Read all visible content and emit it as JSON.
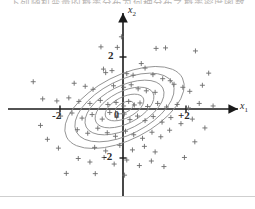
{
  "caption": {
    "text": "下列随机变量的概率分布为何种分布之概率密度函数"
  },
  "figure": {
    "title": "",
    "axes": {
      "x_label": "x",
      "x_sub": "1",
      "y_label": "x",
      "y_sub": "2",
      "origin_label": "0"
    },
    "ticks": {
      "x": [
        {
          "value": -2,
          "label": "-2",
          "px": 60
        },
        {
          "value": 2,
          "label": "+2",
          "px": 186
        }
      ],
      "y": [
        {
          "value": 2,
          "label": "2",
          "px": 57
        },
        {
          "value": -2,
          "label": "-2",
          "px": 158
        }
      ]
    }
  },
  "chart_data": {
    "type": "scatter",
    "title": "",
    "xlabel": "x1",
    "ylabel": "x2",
    "xlim": [
      -3.2,
      3.4
    ],
    "ylim": [
      -3.0,
      3.0
    ],
    "grid": false,
    "legend": null,
    "marker": "plus",
    "marker_color": "#6b6b6b",
    "contour": {
      "type": "gaussian-ellipses",
      "count": 6,
      "center": [
        0.05,
        -0.05
      ],
      "rotation_deg": -27,
      "correlation": 0.72,
      "semi_axes_major": [
        0.34,
        0.72,
        1.08,
        1.45,
        1.82,
        2.18
      ],
      "semi_axes_minor": [
        0.17,
        0.36,
        0.54,
        0.72,
        0.9,
        1.08
      ],
      "line_color": "#8c8c8c"
    },
    "points": [
      [
        -0.7,
        2.46
      ],
      [
        -0.18,
        2.44
      ],
      [
        1.05,
        2.4
      ],
      [
        1.35,
        2.42
      ],
      [
        2.3,
        2.3
      ],
      [
        0.58,
        1.8
      ],
      [
        0.7,
        1.62
      ],
      [
        -0.35,
        1.52
      ],
      [
        -0.62,
        1.58
      ],
      [
        -0.55,
        1.44
      ],
      [
        0.12,
        1.4
      ],
      [
        0.32,
        1.34
      ],
      [
        0.95,
        1.36
      ],
      [
        1.26,
        1.2
      ],
      [
        1.5,
        1.12
      ],
      [
        1.62,
        0.98
      ],
      [
        -1.55,
        1.02
      ],
      [
        -1.2,
        0.9
      ],
      [
        -0.95,
        0.78
      ],
      [
        -0.3,
        0.92
      ],
      [
        0.02,
        0.86
      ],
      [
        0.26,
        0.96
      ],
      [
        0.48,
        0.8
      ],
      [
        0.74,
        0.72
      ],
      [
        1.02,
        0.66
      ],
      [
        1.9,
        0.86
      ],
      [
        2.12,
        0.7
      ],
      [
        2.52,
        0.94
      ],
      [
        -2.55,
        0.4
      ],
      [
        -2.1,
        0.32
      ],
      [
        -1.72,
        0.44
      ],
      [
        -1.4,
        0.3
      ],
      [
        -1.05,
        0.22
      ],
      [
        -0.72,
        0.34
      ],
      [
        -0.48,
        0.18
      ],
      [
        -0.22,
        0.26
      ],
      [
        0.02,
        0.12
      ],
      [
        0.18,
        0.3
      ],
      [
        0.36,
        0.16
      ],
      [
        0.54,
        0.24
      ],
      [
        0.78,
        0.1
      ],
      [
        1.1,
        0.22
      ],
      [
        1.38,
        0.08
      ],
      [
        1.72,
        0.18
      ],
      [
        2.08,
        0.04
      ],
      [
        2.42,
        0.22
      ],
      [
        2.86,
        0.12
      ],
      [
        -1.98,
        -0.28
      ],
      [
        -1.62,
        -0.16
      ],
      [
        -1.3,
        -0.36
      ],
      [
        -0.98,
        -0.22
      ],
      [
        -0.66,
        -0.4
      ],
      [
        -0.42,
        -0.14
      ],
      [
        -0.2,
        -0.32
      ],
      [
        0.04,
        -0.2
      ],
      [
        0.22,
        -0.42
      ],
      [
        0.46,
        -0.28
      ],
      [
        0.7,
        -0.46
      ],
      [
        0.96,
        -0.3
      ],
      [
        1.24,
        -0.52
      ],
      [
        1.52,
        -0.34
      ],
      [
        1.84,
        -0.58
      ],
      [
        2.2,
        -0.4
      ],
      [
        -1.45,
        -0.82
      ],
      [
        -1.12,
        -0.96
      ],
      [
        -0.8,
        -0.76
      ],
      [
        -0.5,
        -0.94
      ],
      [
        -0.24,
        -1.08
      ],
      [
        0.08,
        -0.88
      ],
      [
        0.34,
        -1.02
      ],
      [
        0.62,
        -1.16
      ],
      [
        0.92,
        -0.92
      ],
      [
        1.2,
        -1.1
      ],
      [
        1.48,
        -0.84
      ],
      [
        -0.9,
        -1.52
      ],
      [
        -0.55,
        -1.66
      ],
      [
        -0.1,
        -1.44
      ],
      [
        0.3,
        -1.62
      ],
      [
        0.68,
        -1.48
      ],
      [
        1.02,
        -1.7
      ],
      [
        -1.42,
        -1.96
      ],
      [
        -1.05,
        -2.1
      ],
      [
        -0.6,
        -1.92
      ],
      [
        -0.28,
        -2.18
      ],
      [
        0.12,
        -2.02
      ],
      [
        0.52,
        -2.24
      ],
      [
        0.9,
        -2.06
      ],
      [
        1.3,
        -2.28
      ],
      [
        -0.88,
        -2.56
      ],
      [
        0.05,
        -2.62
      ],
      [
        -2.4,
        -1.2
      ],
      [
        -2.05,
        -1.55
      ],
      [
        -1.8,
        -2.55
      ],
      [
        2.6,
        -0.75
      ],
      [
        2.28,
        -1.3
      ],
      [
        -2.85,
        1.08
      ],
      [
        -2.62,
        -0.65
      ],
      [
        2.72,
        1.42
      ],
      [
        -0.05,
        2.86
      ],
      [
        1.95,
        -1.92
      ]
    ]
  }
}
